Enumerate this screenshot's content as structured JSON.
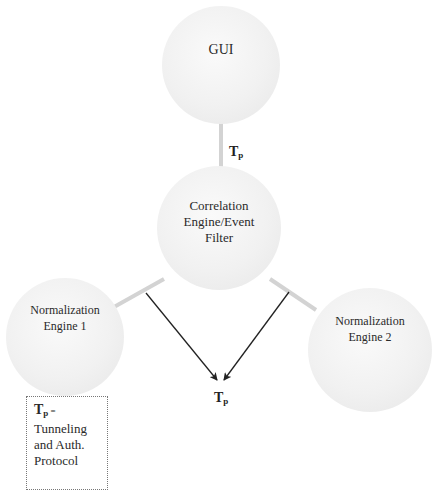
{
  "diagram": {
    "nodes": {
      "gui": {
        "label": "GUI"
      },
      "correlation": {
        "label_lines": [
          "Correlation",
          "Engine/Event",
          "Filter"
        ]
      },
      "norm1": {
        "label_lines": [
          "Normalization",
          "Engine 1"
        ]
      },
      "norm2": {
        "label_lines": [
          "Normalization",
          "Engine 2"
        ]
      }
    },
    "edge_labels": {
      "gui_correlation": {
        "main": "T",
        "sub": "p"
      },
      "arrows": {
        "main": "T",
        "sub": "p"
      }
    },
    "legend": {
      "key_main": "T",
      "key_sub": "p",
      "equals": " =",
      "lines": [
        "Tunneling",
        "and Auth.",
        "Protocol"
      ]
    },
    "colors": {
      "connector": "#d3d3d3",
      "arrow": "#222222",
      "node_fill": "#f2f2f2"
    }
  }
}
